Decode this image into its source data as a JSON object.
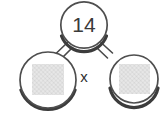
{
  "diagram": {
    "type": "number-bond",
    "background_color": "#ffffff",
    "stroke_color": "#4a4a4a",
    "shadow_color": "#3c3c3c",
    "fill_color": "#ffffff",
    "text_color": "#3a3a3a",
    "hatch_color": "#c9c9c9",
    "nodes": [
      {
        "id": "total",
        "role": "sum",
        "label": "14",
        "value": 14,
        "content_kind": "number",
        "cx": 84,
        "cy": 25,
        "r": 24
      },
      {
        "id": "addend-left",
        "role": "addend",
        "label": "",
        "value": null,
        "content_kind": "hatched-square",
        "cx": 48,
        "cy": 80,
        "r": 29
      },
      {
        "id": "addend-right",
        "role": "addend",
        "label": "",
        "value": null,
        "content_kind": "hatched-square",
        "cx": 134,
        "cy": 79,
        "r": 25
      }
    ],
    "connectors": [
      {
        "id": "connector-left",
        "from": "total",
        "to": "addend-left"
      },
      {
        "id": "connector-right",
        "from": "total",
        "to": "addend-right"
      }
    ],
    "operator": {
      "id": "multiply-operator",
      "label": "x",
      "x": 84,
      "y": 78
    }
  }
}
